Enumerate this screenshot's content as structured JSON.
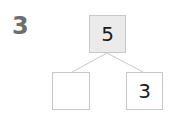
{
  "question_number": "3",
  "number_bond": {
    "whole": "5",
    "parts": [
      "",
      "3"
    ]
  },
  "colors": {
    "whole_fill": "#ebebeb",
    "border": "#c8c8c8",
    "line": "#c8c8c8",
    "question_number": "#6e6e6e"
  }
}
